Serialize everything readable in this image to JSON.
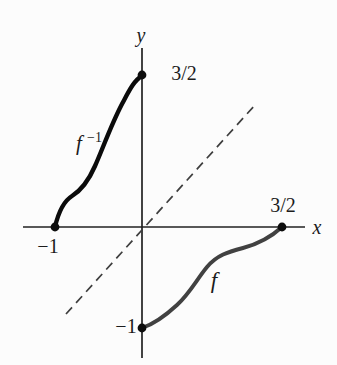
{
  "figure": {
    "background": "#fcfcfc",
    "ink": "#1c1c1c",
    "axis_color": "#222222",
    "identity_line_color": "#3e3e3e",
    "curve_f_color": "#414141",
    "curve_f_inverse_color": "#0b0b0b",
    "dot_color": "#0d0d0d"
  },
  "labels": {
    "y_axis": "y",
    "x_axis": "x",
    "top_value": "3/2",
    "right_value": "3/2",
    "left_value": "−1",
    "bottom_value": "−1",
    "f_inverse_base": "f",
    "f_inverse_sup": "−1",
    "f_label": "f"
  },
  "geometry": {
    "x_axis_d": "M 23 227 L 305 227",
    "y_axis_d": "M 142 48 L 142 358",
    "identity_d": "M 66 314 L 255 105",
    "identity_dash": "9 6",
    "f_inverse_d": "M 55 227 C 58 214 64 201 72 196 C 80 191 88 182 95 166 C 103 148 111 125 122 104 C 128 93 134 80 142 76",
    "f_d": "M 142 328 C 154 324 164 317 177 305 C 190 293 197 279 207 267 C 217 255 228 252 243 248 C 258 244 270 238 282 227",
    "dot_radius": 4.4,
    "dots": {
      "left": {
        "cx": 55,
        "cy": 227
      },
      "top": {
        "cx": 142,
        "cy": 75
      },
      "right": {
        "cx": 282,
        "cy": 227
      },
      "bottom": {
        "cx": 142,
        "cy": 328
      }
    }
  },
  "chart_data": {
    "type": "line",
    "title": "",
    "xlabel": "x",
    "ylabel": "y",
    "xlim": [
      -1.35,
      1.9
    ],
    "ylim": [
      -1.4,
      1.95
    ],
    "grid": false,
    "legend_position": "none",
    "axes_style": "cross-through-origin, no ticks, no arrowheads",
    "series": [
      {
        "name": "f",
        "style": "solid",
        "color": "#414141",
        "x": [
          0,
          0.2,
          0.35,
          0.5,
          0.62,
          0.75,
          0.9,
          1.05,
          1.2,
          1.35,
          1.5
        ],
        "y": [
          -1,
          -0.92,
          -0.8,
          -0.64,
          -0.49,
          -0.36,
          -0.27,
          -0.22,
          -0.18,
          -0.12,
          0
        ]
      },
      {
        "name": "f⁻¹",
        "style": "solid",
        "color": "#0b0b0b",
        "x": [
          -1,
          -0.92,
          -0.8,
          -0.64,
          -0.49,
          -0.36,
          -0.27,
          -0.22,
          -0.18,
          -0.12,
          0
        ],
        "y": [
          0,
          0.2,
          0.35,
          0.5,
          0.62,
          0.75,
          0.9,
          1.05,
          1.2,
          1.35,
          1.5
        ]
      },
      {
        "name": "y = x (identity, dashed)",
        "style": "dashed",
        "color": "#3e3e3e",
        "x": [
          -0.86,
          1.21
        ],
        "y": [
          -0.86,
          1.21
        ]
      }
    ],
    "markers": [
      {
        "x": -1,
        "y": 0,
        "label": "−1",
        "shape": "filled-dot"
      },
      {
        "x": 0,
        "y": 1.5,
        "label": "3/2",
        "shape": "filled-dot"
      },
      {
        "x": 1.5,
        "y": 0,
        "label": "3/2",
        "shape": "filled-dot"
      },
      {
        "x": 0,
        "y": -1,
        "label": "−1",
        "shape": "filled-dot"
      }
    ],
    "annotations": [
      {
        "text": "f⁻¹",
        "x": -0.59,
        "y": 0.85
      },
      {
        "text": "f",
        "x": 0.77,
        "y": -0.59
      }
    ]
  }
}
